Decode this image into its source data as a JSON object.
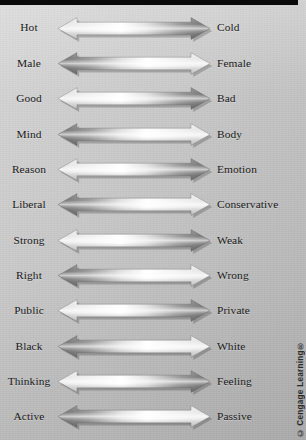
{
  "figure": {
    "background_color": "#c9c9c9",
    "top_bar_color": "#0a0a0a",
    "credit": "© Cengage Learning®",
    "arrow_style": "double-headed metallic gradient",
    "arrow_light_color": "#eeeeee",
    "arrow_mid_color": "#ffffff",
    "arrow_dark_color": "#6e6e6e",
    "rows": [
      {
        "left": "Hot",
        "right": "Cold",
        "emphasis": "right",
        "index": 1
      },
      {
        "left": "Male",
        "right": "Female",
        "emphasis": "left",
        "index": 2
      },
      {
        "left": "Good",
        "right": "Bad",
        "emphasis": "right",
        "index": 3
      },
      {
        "left": "Mind",
        "right": "Body",
        "emphasis": "left",
        "index": 4
      },
      {
        "left": "Reason",
        "right": "Emotion",
        "emphasis": "right",
        "index": 5
      },
      {
        "left": "Liberal",
        "right": "Conservative",
        "emphasis": "left",
        "index": 6
      },
      {
        "left": "Strong",
        "right": "Weak",
        "emphasis": "right",
        "index": 7
      },
      {
        "left": "Right",
        "right": "Wrong",
        "emphasis": "left",
        "index": 8
      },
      {
        "left": "Public",
        "right": "Private",
        "emphasis": "right",
        "index": 9
      },
      {
        "left": "Black",
        "right": "White",
        "emphasis": "left",
        "index": 10
      },
      {
        "left": "Thinking",
        "right": "Feeling",
        "emphasis": "right",
        "index": 11
      },
      {
        "left": "Active",
        "right": "Passive",
        "emphasis": "left",
        "index": 12
      }
    ]
  }
}
